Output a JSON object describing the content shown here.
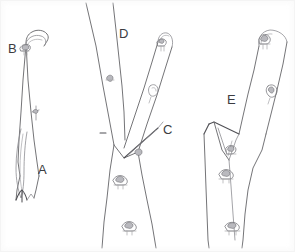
{
  "figure": {
    "background_color": "#ffffff",
    "line_color": "#6d6d70",
    "label_color": "#3c3c41"
  },
  "labels": [
    {
      "id": "B",
      "text": "B",
      "x": 8,
      "y": 53,
      "panel": "left",
      "meaning": "cut-at-top-of-stem"
    },
    {
      "id": "A",
      "text": "A",
      "x": 38,
      "y": 174,
      "panel": "left",
      "meaning": "split-wedge-at-base"
    },
    {
      "id": "D",
      "text": "D",
      "x": 119,
      "y": 38,
      "panel": "middle",
      "meaning": "leader-branch"
    },
    {
      "id": "C",
      "text": "C",
      "x": 163,
      "y": 134,
      "panel": "middle",
      "meaning": "branch-crotch-cut"
    },
    {
      "id": "E",
      "text": "E",
      "x": 227,
      "y": 104,
      "panel": "right",
      "meaning": "tear-wound-at-union"
    }
  ],
  "panels": [
    {
      "id": "left",
      "name": "single-stem-with-basal-split",
      "label_ids": [
        "B",
        "A"
      ],
      "bud_count": 1
    },
    {
      "id": "middle",
      "name": "forked-stem-with-crotch",
      "label_ids": [
        "D",
        "C"
      ],
      "bud_count": 5
    },
    {
      "id": "right",
      "name": "stem-with-torn-union",
      "label_ids": [
        "E"
      ],
      "bud_count": 4
    }
  ]
}
